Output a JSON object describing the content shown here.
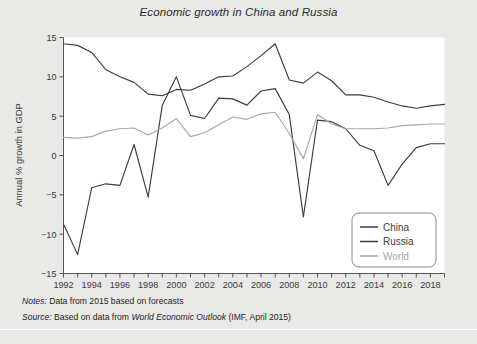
{
  "figure": {
    "title": "Economic growth in China and Russia",
    "background_color": "#e9e9e7",
    "plot_background_color": "#ffffff"
  },
  "notes": {
    "label": "Notes:",
    "text": "Data from 2015 based on forecasts"
  },
  "source": {
    "label": "Source:",
    "text_before": "Based on data from",
    "publication": "World Economic Outlook",
    "text_after": "(IMF, April 2015)"
  },
  "chart_data": {
    "type": "line",
    "title": "Economic growth in China and Russia",
    "xlabel": "",
    "ylabel": "Annual % growth in GDP",
    "xlim": [
      1992,
      2019
    ],
    "ylim": [
      -15,
      15
    ],
    "yticks": [
      -15,
      -10,
      -5,
      0,
      5,
      10,
      15
    ],
    "ytick_labels": [
      "−15",
      "−10",
      "−5",
      "0",
      "5",
      "10",
      "15"
    ],
    "xticks": [
      1992,
      1993,
      1994,
      1995,
      1996,
      1997,
      1998,
      1999,
      2000,
      2001,
      2002,
      2003,
      2004,
      2005,
      2006,
      2007,
      2008,
      2009,
      2010,
      2011,
      2012,
      2013,
      2014,
      2015,
      2016,
      2017,
      2018,
      2019
    ],
    "xtick_labels_shown": [
      1992,
      1994,
      1996,
      1998,
      2000,
      2002,
      2004,
      2006,
      2008,
      2010,
      2012,
      2014,
      2016,
      2018
    ],
    "grid": false,
    "legend_position": "lower right",
    "x": [
      1992,
      1993,
      1994,
      1995,
      1996,
      1997,
      1998,
      1999,
      2000,
      2001,
      2002,
      2003,
      2004,
      2005,
      2006,
      2007,
      2008,
      2009,
      2010,
      2011,
      2012,
      2013,
      2014,
      2015,
      2016,
      2017,
      2018,
      2019
    ],
    "series": [
      {
        "name": "China",
        "color": "#3d3d3d",
        "values": [
          14.2,
          14.0,
          13.1,
          10.9,
          10.0,
          9.3,
          7.8,
          7.6,
          8.4,
          8.3,
          9.1,
          10.0,
          10.1,
          11.3,
          12.7,
          14.2,
          9.6,
          9.2,
          10.6,
          9.5,
          7.7,
          7.7,
          7.4,
          6.8,
          6.3,
          6.0,
          6.3,
          6.5
        ]
      },
      {
        "name": "Russia",
        "color": "#3d3d3d",
        "values": [
          -8.7,
          -12.6,
          -4.1,
          -3.6,
          -3.8,
          1.4,
          -5.3,
          6.4,
          10.0,
          5.1,
          4.7,
          7.3,
          7.2,
          6.4,
          8.2,
          8.5,
          5.2,
          -7.8,
          4.5,
          4.3,
          3.4,
          1.3,
          0.6,
          -3.8,
          -1.1,
          1.0,
          1.5,
          1.5
        ]
      },
      {
        "name": "World",
        "color": "#a8a8a8",
        "values": [
          2.3,
          2.2,
          2.4,
          3.1,
          3.4,
          3.5,
          2.6,
          3.5,
          4.7,
          2.4,
          2.9,
          3.9,
          4.9,
          4.6,
          5.3,
          5.5,
          2.8,
          -0.4,
          5.2,
          4.0,
          3.4,
          3.4,
          3.4,
          3.5,
          3.8,
          3.9,
          4.0,
          4.0
        ]
      }
    ],
    "legend": [
      {
        "label": "China",
        "color": "#3d3d3d"
      },
      {
        "label": "Russia",
        "color": "#3d3d3d"
      },
      {
        "label": "World",
        "color": "#a8a8a8"
      }
    ]
  }
}
